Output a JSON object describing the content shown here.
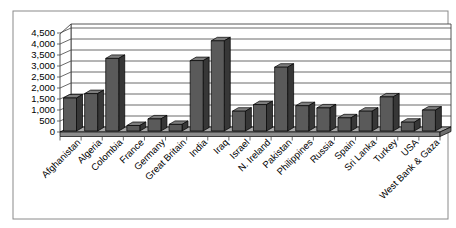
{
  "chart_data": {
    "type": "bar",
    "style": "3d-column",
    "title": "",
    "xlabel": "",
    "ylabel": "",
    "categories": [
      "Afghanistan",
      "Algeria",
      "Colombia",
      "France",
      "Germany",
      "Great Britain",
      "India",
      "Iraq",
      "Israel",
      "N. Ireland",
      "Pakistan",
      "Philippines",
      "Russia",
      "Spain",
      "Sri Lanka",
      "Turkey",
      "USA",
      "West Bank & Gaza"
    ],
    "values": [
      1500,
      1700,
      3300,
      250,
      550,
      300,
      3200,
      4100,
      900,
      1200,
      2900,
      1150,
      1050,
      600,
      900,
      1550,
      400,
      950
    ],
    "ylim": [
      0,
      4500
    ],
    "ytick_step": 500,
    "ytick_labels": [
      "0",
      "500",
      "1,000",
      "1,500",
      "2,000",
      "2,500",
      "3,000",
      "3,500",
      "4,000",
      "4,500"
    ],
    "grid": true,
    "legend": false,
    "colors": {
      "bar_front": "#5a5a5a",
      "bar_side": "#373737",
      "bar_top": "#7d7d7d",
      "outline": "#000000",
      "wall_fill": "#ffffff",
      "wall_line": "#444444",
      "floor_top": "#a8a8a8",
      "floor_front": "#8c8c8c",
      "floor_side": "#6e6e6e",
      "chart_border": "#8a8a8a",
      "text": "#000000"
    }
  }
}
